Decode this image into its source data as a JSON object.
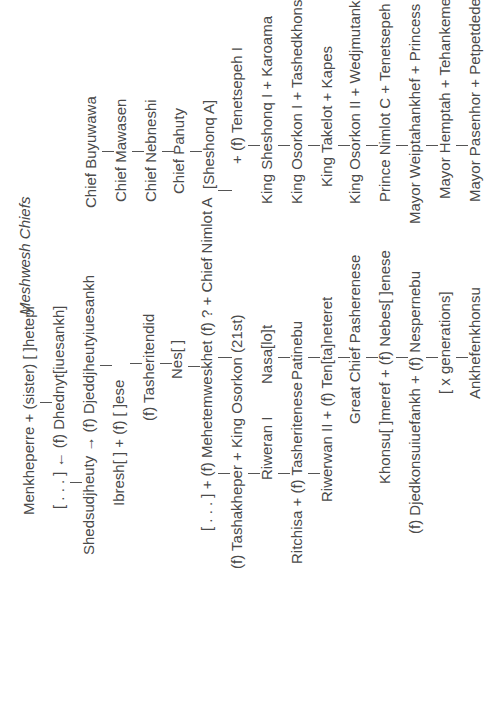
{
  "title": "Meshwesh Chiefs",
  "left_lineage": [
    {
      "id": "menkheperre",
      "text": "Menkheperre  +  (sister) [ ]hetepi"
    },
    {
      "id": "dhednyt",
      "text": "[ . . . ] ← (f) Dhednyt[iuesankh]"
    },
    {
      "id": "shedsudjheuty",
      "text": "Shedsudjheuty → (f)  Djeddjheutyiuesankh"
    },
    {
      "id": "ibresh",
      "text": "Ibresh[ ]        +        (f) [ ]ese"
    },
    {
      "id": "tasheritendid",
      "text": "(f)  Tasheritendid"
    },
    {
      "id": "nes",
      "text": "Nes[ ]"
    },
    {
      "id": "mehetemweskhet",
      "text": "[ . . . ]       +       (f) Mehetemweskhet          (f) ?      +        Chief Nimlot A"
    },
    {
      "id": "tashakheper",
      "text": "(f) Tashakheper + King Osorkon (21st)"
    },
    {
      "id": "riweran1",
      "text": "Riweran I"
    },
    {
      "id": "nasalot",
      "text": "Nasa[lo]t"
    },
    {
      "id": "ritchisa",
      "text": "Ritchisa  +  (f)  Tasheritenese"
    },
    {
      "id": "patinebu",
      "text": "Patinebu"
    },
    {
      "id": "riwerwan2",
      "text": "Riwerwan II   +   (f) Ten[ta]neteret"
    },
    {
      "id": "pasherenese",
      "text": "Great Chief Pasherenese"
    },
    {
      "id": "khonsu",
      "text": "Khonsu[ ]meref  +  (f) Nebes[ ]enese"
    },
    {
      "id": "djedkonsu",
      "text": "(f)  Djedkonsuiuefankh  +  (f) Nespernebu"
    },
    {
      "id": "xgen",
      "text": "[ x generations]"
    },
    {
      "id": "ankhefenkhonsu",
      "text": "Ankhefenkhonsu"
    }
  ],
  "right_lineage": [
    {
      "id": "buyuwawa",
      "text": "Chief Buyuwawa"
    },
    {
      "id": "mawasen",
      "text": "Chief Mawasen"
    },
    {
      "id": "nebneshi",
      "text": "Chief Nebneshi"
    },
    {
      "id": "pahuty",
      "text": "Chief Pahuty"
    },
    {
      "id": "sheshonqa",
      "text": "[Sheshonq A]"
    },
    {
      "id": "tenetsepeh1",
      "text": "+              (f)  Tenetsepeh I"
    },
    {
      "id": "sheshonq1",
      "text": "King Sheshonq I + Karoama"
    },
    {
      "id": "osorkon1",
      "text": "King Osorkon I  +  Tashedkhonsu"
    },
    {
      "id": "takelot",
      "text": "King Takelot   +   Kapes"
    },
    {
      "id": "osorkon2",
      "text": "King Osorkon II  +  Wedjmutankhes"
    },
    {
      "id": "nimlotc",
      "text": "Prince Nimlot C  +  Tenetsepeh II"
    },
    {
      "id": "weiptahankhef",
      "text": "Mayor Weiptahankhef  +  Princess Tenetsepeh"
    },
    {
      "id": "hemptah",
      "text": "Mayor Hemptah  +  Tehankeme"
    },
    {
      "id": "pasenhor",
      "text": "Mayor Pasenhor  +  Petpetdedes"
    }
  ]
}
